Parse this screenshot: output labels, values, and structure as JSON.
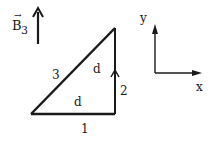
{
  "field": {
    "symbol": "B",
    "subscript": "3",
    "vector_mark": "→",
    "direction": "up"
  },
  "triangle": {
    "sides": [
      {
        "id": "1",
        "label": "1",
        "length_label": ""
      },
      {
        "id": "2",
        "label": "2",
        "length_label": "d"
      },
      {
        "id": "3",
        "label": "3",
        "length_label": ""
      }
    ],
    "base_length_label": "d",
    "current_direction_on_side_2": "up"
  },
  "axes": {
    "x_label": "x",
    "y_label": "y"
  }
}
